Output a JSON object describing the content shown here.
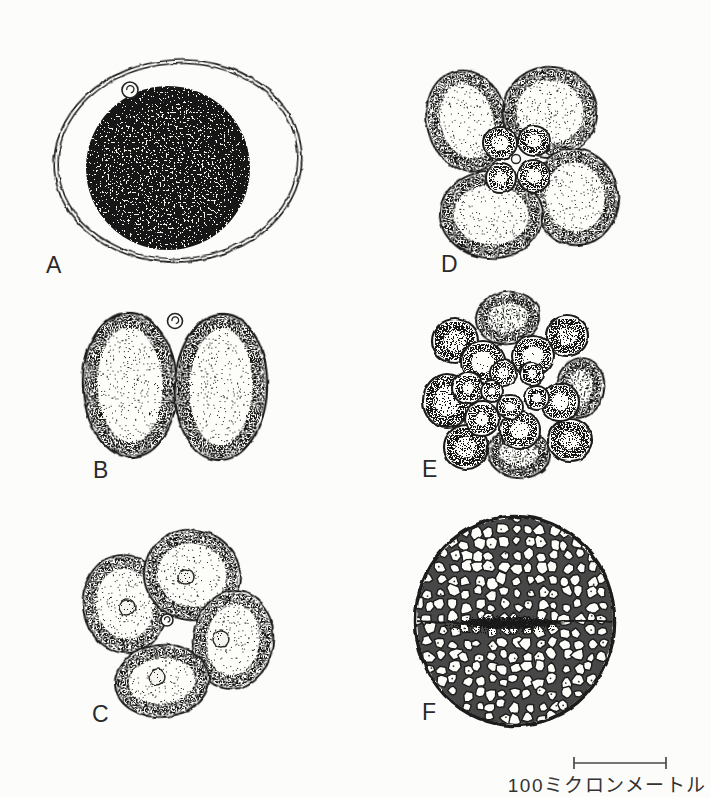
{
  "page": {
    "background": "#fcfcfa"
  },
  "figure": {
    "panels": [
      {
        "label": "A"
      },
      {
        "label": "B"
      },
      {
        "label": "C"
      },
      {
        "label": "D"
      },
      {
        "label": "E"
      },
      {
        "label": "F"
      }
    ],
    "scale_bar": {
      "label": "100ミクロンメートル"
    },
    "ink_color": "#1e1e1e",
    "paper_color": "#fcfcfa"
  }
}
